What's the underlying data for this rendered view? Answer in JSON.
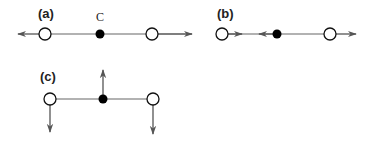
{
  "figure": {
    "colors": {
      "line": "#666666",
      "arrow": "#555555",
      "open_node_stroke": "#111111",
      "open_node_fill": "#ffffff",
      "filled_node": "#000000"
    },
    "panels": [
      {
        "label": "(a)",
        "center_label": "C",
        "description": "Three nodes in a row; outer open nodes with arrows pointing outward horizontally"
      },
      {
        "label": "(b)",
        "description": "Three nodes in a row; left open node arrow points right (inward), center filled node arrow points left, right open node arrow points right"
      },
      {
        "label": "(c)",
        "description": "Three nodes in a row; center filled node arrow points up, outer open nodes arrows point down"
      }
    ]
  }
}
